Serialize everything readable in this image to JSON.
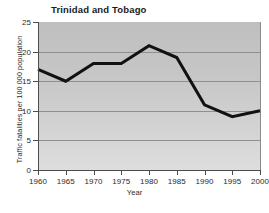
{
  "chart_data": {
    "type": "line",
    "title": "Trinidad and Tobago",
    "xlabel": "Year",
    "ylabel": "Traffic fatalities per 100 000 population",
    "x": [
      1960,
      1965,
      1970,
      1975,
      1980,
      1985,
      1990,
      1995,
      2000
    ],
    "values": [
      17,
      15,
      18,
      18,
      21,
      19,
      11,
      9,
      10
    ],
    "series": [
      {
        "name": "Traffic fatalities per 100 000 population",
        "values": [
          17,
          15,
          18,
          18,
          21,
          19,
          11,
          9,
          10
        ]
      }
    ],
    "xtick_labels": [
      "1960",
      "1965",
      "1970",
      "1975",
      "1980",
      "1985",
      "1990",
      "1995",
      "2000"
    ],
    "ytick_labels": [
      "0",
      "5",
      "10",
      "15",
      "20",
      "25"
    ],
    "ytick_values": [
      0,
      5,
      10,
      15,
      20,
      25
    ],
    "xlim": [
      1960,
      2000
    ],
    "ylim": [
      0,
      25
    ],
    "grid": "horizontal",
    "legend": "none",
    "line_color": "#111111",
    "plot_background_top": "#bfbfbf",
    "plot_background_bottom": "#dedede",
    "gridline_color": "#8f8f8f",
    "axis_color": "#4d4d4d"
  },
  "footer": {
    "text": ""
  }
}
